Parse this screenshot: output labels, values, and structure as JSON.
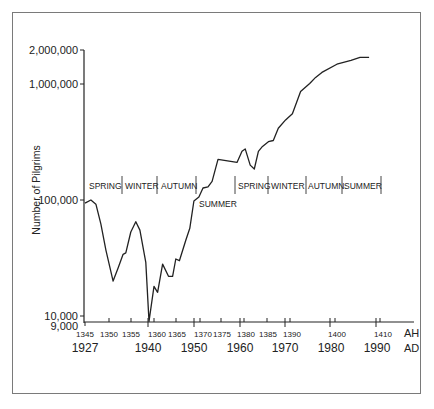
{
  "chart_data": {
    "type": "line",
    "title": "",
    "xlabel": "AH / AD",
    "ylabel": "Number of Pilgrims",
    "yscale": "log",
    "ylim": [
      9000,
      2000000
    ],
    "grid": false,
    "legend": null,
    "y_ticks": [
      {
        "value": 2000000,
        "label": "2,000,000"
      },
      {
        "value": 1000000,
        "label": "1,000,000"
      },
      {
        "value": 100000,
        "label": "100,000"
      },
      {
        "value": 10000,
        "label": "10,000"
      },
      {
        "value": 9000,
        "label": "9,000"
      }
    ],
    "x_ticks_ah": [
      {
        "year": 1345,
        "label": "1345"
      },
      {
        "year": 1350,
        "label": "1350"
      },
      {
        "year": 1355,
        "label": "1355"
      },
      {
        "year": 1360,
        "label": "1360"
      },
      {
        "year": 1365,
        "label": "1365"
      },
      {
        "year": 1370,
        "label": "1370"
      },
      {
        "year": 1375,
        "label": "1375"
      },
      {
        "year": 1380,
        "label": "1380"
      },
      {
        "year": 1385,
        "label": "1385"
      },
      {
        "year": 1390,
        "label": "1390"
      },
      {
        "year": 1400,
        "label": "1400"
      },
      {
        "year": 1410,
        "label": "1410"
      }
    ],
    "x_ticks_ad": [
      {
        "year": 1927,
        "label": "1927"
      },
      {
        "year": 1940,
        "label": "1940"
      },
      {
        "year": 1950,
        "label": "1950"
      },
      {
        "year": 1960,
        "label": "1960"
      },
      {
        "year": 1970,
        "label": "1970"
      },
      {
        "year": 1980,
        "label": "1980"
      },
      {
        "year": 1990,
        "label": "1990"
      }
    ],
    "axis_unit_labels": {
      "ah": "AH",
      "ad": "AD"
    },
    "series": [
      {
        "name": "Number of Pilgrims",
        "x_ah": [
          1345,
          1346.3,
          1347.4,
          1348.5,
          1349.6,
          1351.2,
          1352.3,
          1353.4,
          1354.0,
          1355.1,
          1356.2,
          1357.1,
          1358.4,
          1359.1,
          1360.2,
          1361.0,
          1362.1,
          1363.4,
          1364.3,
          1365.0,
          1365.8,
          1367.2,
          1368.1,
          1369.0,
          1370.1,
          1371.0,
          1372.1,
          1373.0,
          1374.3,
          1378.5,
          1379.6,
          1380.3,
          1381.4,
          1382.3,
          1383.2,
          1384.1,
          1385.4,
          1386.5,
          1387.6,
          1389.2,
          1390.7,
          1392.5,
          1394.5,
          1395.8,
          1397.2,
          1400.5,
          1403.6,
          1405.6,
          1407.6
        ],
        "values": [
          94000,
          100000,
          92000,
          62000,
          37000,
          20000,
          26000,
          34000,
          35000,
          53000,
          65000,
          55000,
          29000,
          9000,
          18000,
          16000,
          28000,
          22000,
          22000,
          31000,
          30000,
          45000,
          57000,
          98000,
          106000,
          127000,
          130000,
          145000,
          224000,
          211000,
          263000,
          276000,
          200000,
          185000,
          263000,
          290000,
          318000,
          326000,
          415000,
          490000,
          555000,
          860000,
          1010000,
          1140000,
          1260000,
          1480000,
          1600000,
          1700000,
          1700000
        ]
      }
    ],
    "annotations": {
      "groups": [
        {
          "labels": [
            "SPRING",
            "WINTER",
            "AUTUMN"
          ]
        },
        {
          "labels": [
            "SUMMER"
          ]
        },
        {
          "labels": [
            "SPRING",
            "WINTER",
            "AUTUMN",
            "SUMMER"
          ]
        }
      ]
    }
  },
  "labels": {
    "ylabel": "Number of Pilgrims",
    "ah": "AH",
    "ad": "AD",
    "y": [
      "2,000,000",
      "1,000,000",
      "100,000",
      "10,000",
      "9,000"
    ],
    "ah_ticks": [
      "1345",
      "1350",
      "1355",
      "1360",
      "1365",
      "1370",
      "1375",
      "1380",
      "1385",
      "1390",
      "1400",
      "1410"
    ],
    "ad_ticks": [
      "1927",
      "1940",
      "1950",
      "1960",
      "1970",
      "1980",
      "1990"
    ],
    "seasons1": [
      "SPRING",
      "WINTER",
      "AUTUMN"
    ],
    "season_summer": "SUMMER",
    "seasons2": [
      "SPRING",
      "WINTER",
      "AUTUMN",
      "SUMMER"
    ]
  }
}
